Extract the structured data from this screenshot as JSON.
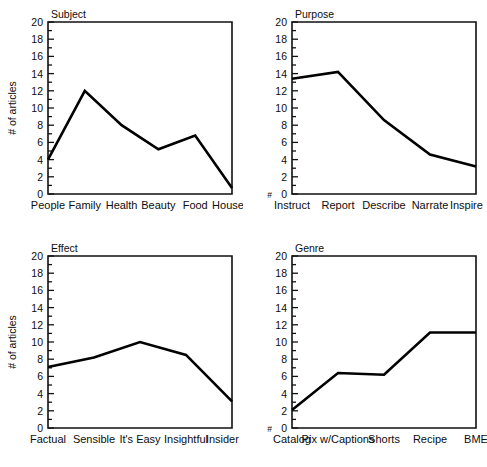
{
  "figure": {
    "panel_count": 4,
    "y_axis_label": "# of articles",
    "y_ticks": [
      0,
      2,
      4,
      6,
      8,
      10,
      12,
      14,
      16,
      18,
      20
    ],
    "hash_marker": "#"
  },
  "chart_data": [
    {
      "type": "line",
      "title": "Subject",
      "xlabel": "",
      "ylabel": "# of articles",
      "ylim": [
        0,
        20
      ],
      "grid": false,
      "legend": "none",
      "categories": [
        "People",
        "Family",
        "Health",
        "Beauty",
        "Food",
        "House"
      ],
      "values": [
        4.0,
        12.0,
        8.0,
        5.2,
        6.8,
        0.7
      ],
      "show_ylabel": true,
      "show_hash": false
    },
    {
      "type": "line",
      "title": "Purpose",
      "xlabel": "",
      "ylabel": "",
      "ylim": [
        0,
        20
      ],
      "grid": false,
      "legend": "none",
      "categories": [
        "Instruct",
        "Report",
        "Describe",
        "Narrate",
        "Inspire"
      ],
      "values": [
        13.4,
        14.2,
        8.6,
        4.6,
        3.2
      ],
      "show_ylabel": false,
      "show_hash": true
    },
    {
      "type": "line",
      "title": "Effect",
      "xlabel": "",
      "ylabel": "# of articles",
      "ylim": [
        0,
        20
      ],
      "grid": false,
      "legend": "none",
      "categories": [
        "Factual",
        "Sensible",
        "It's Easy",
        "Insightful",
        "Insider"
      ],
      "values": [
        7.1,
        8.2,
        10.0,
        8.5,
        3.1
      ],
      "show_ylabel": true,
      "show_hash": false
    },
    {
      "type": "line",
      "title": "Genre",
      "xlabel": "",
      "ylabel": "",
      "ylim": [
        0,
        20
      ],
      "grid": false,
      "legend": "none",
      "categories": [
        "Catalog",
        "Pix w/Captions",
        "Shorts",
        "Recipe",
        "BME"
      ],
      "values": [
        2.1,
        6.4,
        6.2,
        11.1,
        11.1
      ],
      "show_ylabel": false,
      "show_hash": true
    }
  ]
}
